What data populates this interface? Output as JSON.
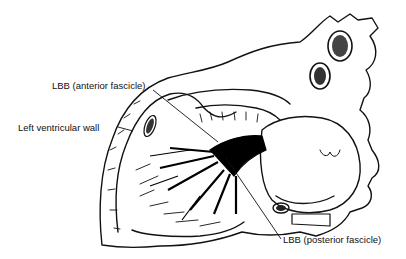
{
  "diagram": {
    "labels": {
      "anterior_fascicle": "LBB (anterior fascicle)",
      "left_ventricular_wall": "Left ventricular wall",
      "posterior_fascicle": "LBB (posterior fascicle)"
    },
    "colors": {
      "ink": "#111111",
      "background": "#ffffff",
      "conduction_fill": "#000000"
    }
  }
}
